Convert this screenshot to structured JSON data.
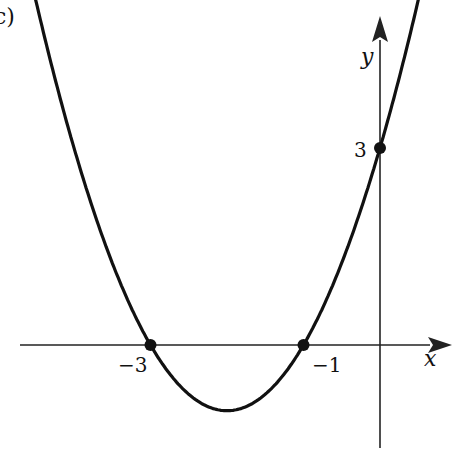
{
  "panel_label": "c)",
  "chart_data": {
    "type": "line",
    "title": "",
    "function": "y = x^2 + 4x + 3",
    "xlabel": "x",
    "ylabel": "y",
    "x_ticks": [
      {
        "value": -3,
        "label": "−3"
      },
      {
        "value": -1,
        "label": "−1"
      }
    ],
    "y_ticks": [
      {
        "value": 3,
        "label": "3"
      }
    ],
    "marked_points": [
      {
        "x": -3,
        "y": 0
      },
      {
        "x": -1,
        "y": 0
      },
      {
        "x": 0,
        "y": 3
      }
    ],
    "vertex": {
      "x": -2,
      "y": -1
    },
    "xlim": [
      -4.8,
      0.8
    ],
    "ylim": [
      -1.6,
      5.2
    ],
    "grid": false,
    "legend": null
  },
  "style": {
    "curve_color": "#111111",
    "axis_color": "#222222",
    "origin_px": [
      380,
      345
    ],
    "px_per_unit_x": 76.5,
    "px_per_unit_y": 65.7
  }
}
